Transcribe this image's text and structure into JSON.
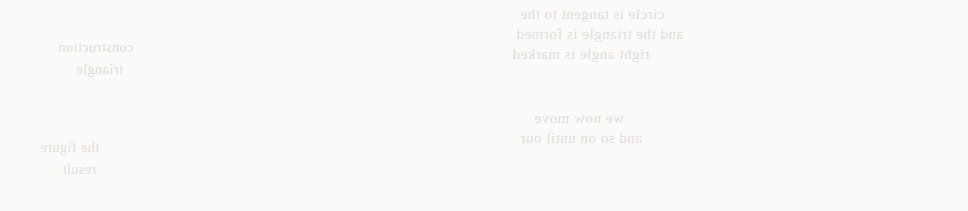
{
  "page": {
    "kind": "scanned-book-figure",
    "caption": "",
    "background_color": "#fbfaf8",
    "figure_count": 8,
    "grid": {
      "columns": 4,
      "rows": 2
    }
  },
  "style": {
    "fill_color": "#d2d2d2",
    "stroke_color": "#4a4a4a",
    "white_color": "#fbfaf8",
    "ghost_text_color": "#c9c6c2",
    "stroke_width": 1.2
  },
  "ghost_text": {
    "note": "faint mirrored bleed-through from the reverse page; illegible in the scan",
    "lines": [
      {
        "text": "circle is tangent to the",
        "x": 520,
        "y": 6,
        "size": 15
      },
      {
        "text": "and the triangle is formed",
        "x": 516,
        "y": 26,
        "size": 15
      },
      {
        "text": "right angle is marked",
        "x": 512,
        "y": 46,
        "size": 15
      },
      {
        "text": "we now move",
        "x": 534,
        "y": 110,
        "size": 15
      },
      {
        "text": "and so on until our",
        "x": 520,
        "y": 130,
        "size": 15
      },
      {
        "text": "construction",
        "x": 58,
        "y": 40,
        "size": 14
      },
      {
        "text": "triangle",
        "x": 76,
        "y": 62,
        "size": 14
      },
      {
        "text": "the figure",
        "x": 40,
        "y": 140,
        "size": 14
      },
      {
        "text": "result",
        "x": 62,
        "y": 162,
        "size": 14
      }
    ]
  },
  "geometry": {
    "triangle": {
      "description": "scalene triangle with apex right of centre, flat base",
      "left_vertex": {
        "x": 22,
        "y": 87
      },
      "apex": {
        "x": 148,
        "y": 7
      },
      "right_vertex": {
        "x": 228,
        "y": 87
      }
    },
    "incircle": {
      "cx": 148,
      "cy": 61,
      "r": 26
    }
  },
  "figures": [
    {
      "index": 1,
      "name": "incircle-only",
      "label": "",
      "panel": {
        "row": 1,
        "col": 1
      },
      "divider_x": null,
      "left_region_shaded": false,
      "right_region_shaded": false,
      "circle": {
        "cx": 148,
        "cy": 61,
        "r": 26,
        "shape": "circle",
        "shaded": true
      }
    },
    {
      "index": 2,
      "name": "left-region-small-shaded",
      "label": "",
      "panel": {
        "row": 1,
        "col": 2
      },
      "divider_x": 66,
      "left_region_shaded": true,
      "right_region_shaded": false,
      "circle": {
        "cx": 148,
        "cy": 61,
        "r": 26,
        "shape": "circle",
        "shaded": true
      }
    },
    {
      "index": 3,
      "name": "left-region-medium-shaded",
      "label": "",
      "panel": {
        "row": 1,
        "col": 3
      },
      "divider_x": 96,
      "left_region_shaded": true,
      "right_region_shaded": false,
      "circle": {
        "cx": 152,
        "cy": 61,
        "r": 26,
        "shape": "capsule",
        "capsule_right": 192,
        "shaded": true
      }
    },
    {
      "index": 4,
      "name": "left-region-large-shaded-capsule",
      "label": "",
      "panel": {
        "row": 1,
        "col": 4
      },
      "divider_x": 122,
      "left_region_shaded": true,
      "right_region_shaded": false,
      "circle": {
        "cx": 152,
        "cy": 61,
        "r": 26,
        "shape": "capsule",
        "capsule_right": 222,
        "shaded": true
      }
    },
    {
      "index": 5,
      "name": "full-shaded-thin-white-strip",
      "label": "",
      "panel": {
        "row": 2,
        "col": 1
      },
      "divider_x": 140,
      "strip_width": 14,
      "left_region_shaded": true,
      "right_region_shaded": true,
      "circle": null
    },
    {
      "index": 6,
      "name": "capsule-left-right-region-shaded",
      "label": "",
      "panel": {
        "row": 2,
        "col": 2
      },
      "divider_x": 160,
      "left_region_shaded": false,
      "right_region_shaded": true,
      "circle": {
        "cx": 122,
        "cy": 61,
        "r": 26,
        "shape": "capsule",
        "capsule_left": 64,
        "shaded": true
      }
    },
    {
      "index": 7,
      "name": "incircle-with-right-wedge",
      "label": "",
      "panel": {
        "row": 2,
        "col": 3
      },
      "divider_x": 186,
      "left_region_shaded": false,
      "right_region_shaded": true,
      "circle": {
        "cx": 144,
        "cy": 61,
        "r": 26,
        "shape": "circle",
        "shaded": true
      }
    },
    {
      "index": 8,
      "name": "incircle-only-final",
      "label": "",
      "panel": {
        "row": 2,
        "col": 4
      },
      "divider_x": null,
      "left_region_shaded": false,
      "right_region_shaded": false,
      "circle": {
        "cx": 148,
        "cy": 61,
        "r": 26,
        "shape": "circle",
        "shaded": true
      }
    }
  ]
}
